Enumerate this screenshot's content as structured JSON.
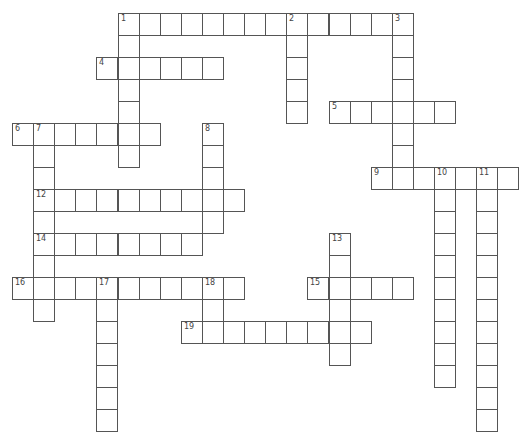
{
  "puzzle": {
    "type": "crossword",
    "cell_width": 21.1,
    "cell_height": 22,
    "origin_x": 12,
    "origin_y": 13,
    "line_color": "#555555",
    "words": [
      {
        "number": "1",
        "dir": "across",
        "col": 5,
        "row": 0,
        "length": 14
      },
      {
        "number": "1",
        "dir": "down",
        "col": 5,
        "row": 0,
        "length": 7
      },
      {
        "number": "2",
        "dir": "down",
        "col": 13,
        "row": 0,
        "length": 5
      },
      {
        "number": "3",
        "dir": "down",
        "col": 18,
        "row": 0,
        "length": 8
      },
      {
        "number": "4",
        "dir": "across",
        "col": 4,
        "row": 2,
        "length": 6
      },
      {
        "number": "5",
        "dir": "across",
        "col": 15,
        "row": 4,
        "length": 6
      },
      {
        "number": "6",
        "dir": "across",
        "col": 0,
        "row": 5,
        "length": 7
      },
      {
        "number": "7",
        "dir": "down",
        "col": 1,
        "row": 5,
        "length": 9
      },
      {
        "number": "8",
        "dir": "down",
        "col": 9,
        "row": 5,
        "length": 5
      },
      {
        "number": "9",
        "dir": "across",
        "col": 17,
        "row": 7,
        "length": 7
      },
      {
        "number": "10",
        "dir": "down",
        "col": 20,
        "row": 7,
        "length": 10
      },
      {
        "number": "11",
        "dir": "down",
        "col": 22,
        "row": 7,
        "length": 12
      },
      {
        "number": "12",
        "dir": "across",
        "col": 1,
        "row": 8,
        "length": 10
      },
      {
        "number": "13",
        "dir": "down",
        "col": 15,
        "row": 10,
        "length": 6
      },
      {
        "number": "14",
        "dir": "across",
        "col": 1,
        "row": 10,
        "length": 8
      },
      {
        "number": "15",
        "dir": "across",
        "col": 14,
        "row": 12,
        "length": 5
      },
      {
        "number": "16",
        "dir": "across",
        "col": 0,
        "row": 12,
        "length": 11
      },
      {
        "number": "17",
        "dir": "down",
        "col": 4,
        "row": 12,
        "length": 7
      },
      {
        "number": "18",
        "dir": "down",
        "col": 9,
        "row": 12,
        "length": 3
      },
      {
        "number": "19",
        "dir": "across",
        "col": 8,
        "row": 14,
        "length": 9
      }
    ]
  }
}
